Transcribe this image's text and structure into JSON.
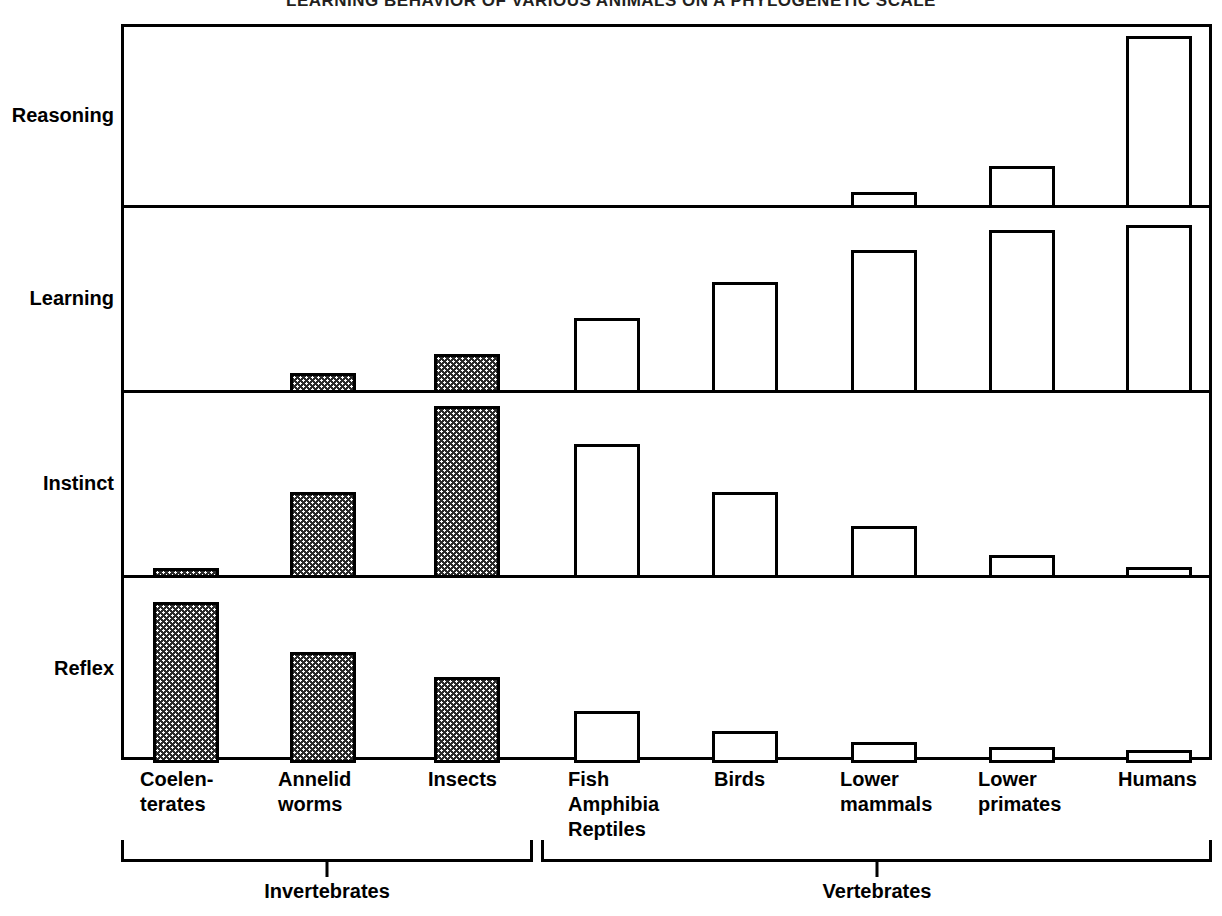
{
  "title": "LEARNING BEHAVIOR OF VARIOUS ANIMALS ON A PHYLOGENETIC SCALE",
  "row_labels": [
    "Reasoning",
    "Learning",
    "Instinct",
    "Reflex"
  ],
  "x_labels": [
    {
      "lines": [
        "Coelen-",
        "terates"
      ]
    },
    {
      "lines": [
        "Annelid",
        "worms"
      ]
    },
    {
      "lines": [
        "Insects"
      ]
    },
    {
      "lines": [
        "Fish",
        "Amphibia",
        "Reptiles"
      ]
    },
    {
      "lines": [
        "Birds"
      ]
    },
    {
      "lines": [
        "Lower",
        "mammals"
      ]
    },
    {
      "lines": [
        "Lower",
        "primates"
      ]
    },
    {
      "lines": [
        "Humans"
      ]
    }
  ],
  "groups": [
    {
      "label": "Invertebrates"
    },
    {
      "label": "Vertebrates"
    }
  ],
  "colors": {
    "ink": "#000000",
    "bar_invertebrate_fill": "#2b2b2b",
    "bar_vertebrate_fill": "#ffffff",
    "background": "#ffffff"
  },
  "chart_data": {
    "type": "bar",
    "title": "LEARNING BEHAVIOR OF VARIOUS ANIMALS ON A PHYLOGENETIC SCALE",
    "xlabel": "",
    "ylabel": "",
    "grid": false,
    "legend": "none",
    "note": "Four stacked panels (rows). Each row is an independent behavior category; bar height is a relative magnitude on a 0-100 scale with no numeric axis printed in the figure.",
    "categories": [
      "Coelenterates",
      "Annelid worms",
      "Insects",
      "Fish Amphibia Reptiles",
      "Birds",
      "Lower mammals",
      "Lower primates",
      "Humans"
    ],
    "category_groups": [
      "Invertebrates",
      "Invertebrates",
      "Invertebrates",
      "Vertebrates",
      "Vertebrates",
      "Vertebrates",
      "Vertebrates",
      "Vertebrates"
    ],
    "panels": [
      {
        "name": "Reasoning",
        "ylim": [
          0,
          100
        ],
        "values": [
          0,
          0,
          0,
          0,
          0,
          9,
          24,
          98
        ]
      },
      {
        "name": "Learning",
        "ylim": [
          0,
          100
        ],
        "values": [
          0,
          11,
          22,
          42,
          62,
          80,
          91,
          94
        ]
      },
      {
        "name": "Instinct",
        "ylim": [
          0,
          100
        ],
        "values": [
          5,
          48,
          96,
          75,
          48,
          29,
          13,
          6
        ]
      },
      {
        "name": "Reflex",
        "ylim": [
          0,
          100
        ],
        "values": [
          90,
          62,
          48,
          29,
          18,
          12,
          9,
          7
        ]
      }
    ],
    "series": [
      {
        "name": "Reasoning",
        "values": [
          0,
          0,
          0,
          0,
          0,
          9,
          24,
          98
        ]
      },
      {
        "name": "Learning",
        "values": [
          0,
          11,
          22,
          42,
          62,
          80,
          91,
          94
        ]
      },
      {
        "name": "Instinct",
        "values": [
          5,
          48,
          96,
          75,
          48,
          29,
          13,
          6
        ]
      },
      {
        "name": "Reflex",
        "values": [
          90,
          62,
          48,
          29,
          18,
          12,
          9,
          7
        ]
      }
    ]
  }
}
